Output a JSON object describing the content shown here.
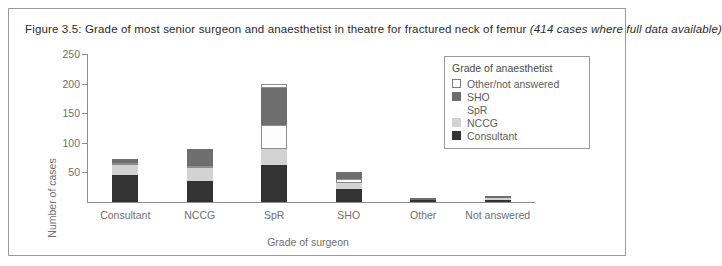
{
  "figure": {
    "title_main": "Figure 3.5: Grade of most senior surgeon and anaesthetist in theatre for fractured neck of femur ",
    "title_italic": "(414 cases where full data available)"
  },
  "legend": {
    "title": "Grade of anaesthetist",
    "entries": [
      {
        "label": "Other/not answered",
        "color": "#ffffff",
        "border": "#7d7d7d"
      },
      {
        "label": "SHO",
        "color": "#6e6e6e",
        "border": "#6e6e6e"
      },
      {
        "label": "SpR",
        "color": "#fdfdfd",
        "border": "#fdfdfd"
      },
      {
        "label": "NCCG",
        "color": "#d2d2d2",
        "border": "#d2d2d2"
      },
      {
        "label": "Consultant",
        "color": "#333333",
        "border": "#333333"
      }
    ]
  },
  "chart_data": {
    "type": "bar",
    "subtype": "stacked-vertical",
    "title": "Grade of most senior surgeon and anaesthetist in theatre for fractured neck of femur",
    "xlabel": "Grade of surgeon",
    "ylabel": "Number of cases",
    "ylim": [
      0,
      250
    ],
    "yticks": [
      0,
      50,
      100,
      150,
      200,
      250
    ],
    "ytick_labels": [
      "",
      "50",
      "100",
      "150",
      "200",
      "250"
    ],
    "grid": false,
    "legend_position": "top-right-inside",
    "total_cases": 414,
    "categories": [
      "Consultant",
      "NCCG",
      "SpR",
      "SHO",
      "Other",
      "Not answered"
    ],
    "series": [
      {
        "name": "Consultant",
        "color": "#333333",
        "values": [
          45,
          35,
          62,
          22,
          3,
          4
        ]
      },
      {
        "name": "NCCG",
        "color": "#d2d2d2",
        "values": [
          18,
          23,
          28,
          10,
          0,
          2
        ]
      },
      {
        "name": "SpR",
        "color": "#fdfdfd",
        "values": [
          3,
          2,
          40,
          7,
          0,
          0
        ]
      },
      {
        "name": "SHO",
        "color": "#6e6e6e",
        "values": [
          6,
          30,
          63,
          12,
          1,
          2
        ]
      },
      {
        "name": "Other/not answered",
        "color": "#ffffff",
        "values": [
          0,
          0,
          6,
          0,
          0,
          0
        ]
      }
    ],
    "totals": [
      72,
      90,
      199,
      51,
      4,
      8
    ]
  },
  "colors": {
    "axis": "#8d8d8d",
    "tick_text": "#6f6f6f",
    "frame": "#9a9a9a",
    "title_text": "#2a2a2a"
  }
}
